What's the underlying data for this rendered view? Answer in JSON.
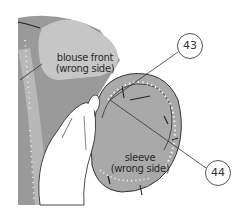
{
  "diagram": {
    "labels": {
      "blouse_front_line1": "blouse front",
      "blouse_front_line2": "(wrong side)",
      "sleeve_line1": "sleeve",
      "sleeve_line2": "(wrong side)"
    },
    "callouts": [
      {
        "number": "43"
      },
      {
        "number": "44"
      }
    ],
    "colors": {
      "fabric_dark": "#9a9a9a",
      "fabric_light": "#c4c4c4",
      "sleeve": "#a8a8a8",
      "stitch_dots": "#f2f2f2",
      "outline": "#333333",
      "hand": "#ffffff"
    }
  }
}
